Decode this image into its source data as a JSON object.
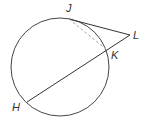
{
  "diagram": {
    "type": "circle-secant-tangent",
    "circle": {
      "cx": 60,
      "cy": 67,
      "r": 49
    },
    "points": {
      "J": {
        "label": "J",
        "x": 69,
        "y": 19
      },
      "K": {
        "label": "K",
        "x": 107,
        "y": 50
      },
      "L": {
        "label": "L",
        "x": 130,
        "y": 35
      },
      "H": {
        "label": "H",
        "x": 27,
        "y": 102
      }
    },
    "segments": [
      {
        "from": "J",
        "to": "L",
        "style": "solid"
      },
      {
        "from": "H",
        "to": "L",
        "style": "solid"
      },
      {
        "from": "J",
        "to": "K",
        "style": "dashed"
      }
    ],
    "colors": {
      "stroke": "#333333",
      "dashed": "#aaaaaa"
    }
  }
}
